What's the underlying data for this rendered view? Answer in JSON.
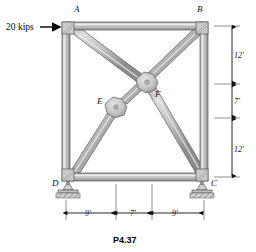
{
  "figure": {
    "caption": "P4.37",
    "load": {
      "label": "20 kips",
      "applied_at": "A",
      "direction": "right"
    },
    "joints": {
      "a": "A",
      "b": "B",
      "c": "C",
      "d": "D",
      "e": "E",
      "f": "F"
    },
    "vertical_dimensions": {
      "top": "12'",
      "middle": "7'",
      "bottom": "12'"
    },
    "horizontal_dimensions": {
      "left": "9'",
      "middle": "7'",
      "right": "9'"
    },
    "colors": {
      "member_fill": "#b9b9b9",
      "member_light": "#dcdcdc",
      "member_dark": "#8f8f8f",
      "outline": "#4a4a4a",
      "support_fill": "#c8c8c8",
      "hatch": "#8a8a8a",
      "text": "#111111"
    }
  }
}
